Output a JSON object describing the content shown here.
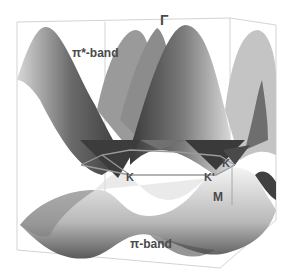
{
  "figure": {
    "labels": {
      "gamma": "Γ",
      "pi_star_band": "π*-band",
      "pi_band": "π-band",
      "k1": "K",
      "k2": "K'",
      "k3": "K",
      "m": "M"
    },
    "colors": {
      "surface_dark": "#3c3c3c",
      "surface_light": "#e8e8e8",
      "box_line": "#c8c8c8",
      "brillouin_zone_line": "#9a9a9a",
      "label": "#4a4a4a"
    }
  }
}
